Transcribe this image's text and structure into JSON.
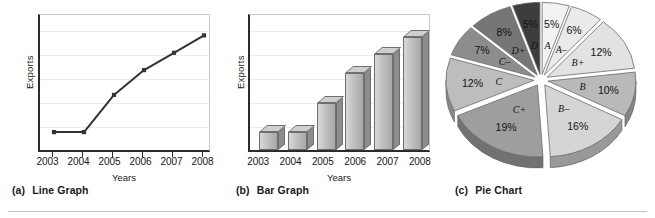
{
  "figure": {
    "panels": [
      {
        "caption_index": "(a)",
        "caption_label": "Line Graph"
      },
      {
        "caption_index": "(b)",
        "caption_label": "Bar Graph"
      },
      {
        "caption_index": "(c)",
        "caption_label": "Pie Chart"
      }
    ]
  },
  "chart_data": [
    {
      "type": "line",
      "title": "Line Graph",
      "xlabel": "Years",
      "ylabel": "Exports",
      "categories": [
        "2003",
        "2004",
        "2005",
        "2006",
        "2007",
        "2008"
      ],
      "x": [
        2003,
        2004,
        2005,
        2006,
        2007,
        2008
      ],
      "values": [
        12,
        12,
        42,
        62,
        76,
        90
      ],
      "ylim": [
        0,
        100
      ],
      "axis_values_shown": false,
      "grid": true,
      "legend": "none",
      "marker": "square"
    },
    {
      "type": "bar",
      "title": "Bar Graph",
      "xlabel": "Years",
      "ylabel": "Exports",
      "categories": [
        "2003",
        "2004",
        "2005",
        "2006",
        "2007",
        "2008"
      ],
      "values": [
        14,
        14,
        37,
        60,
        75,
        88
      ],
      "ylim": [
        0,
        100
      ],
      "axis_values_shown": false,
      "grid": true,
      "legend": "none",
      "style": "3d-column"
    },
    {
      "type": "pie",
      "title": "Pie Chart",
      "style": "exploded-3d",
      "legend": "none",
      "labels": [
        "A",
        "A–",
        "B+",
        "B",
        "B–",
        "C+",
        "C",
        "C–",
        "D+",
        "D"
      ],
      "values": [
        5,
        6,
        12,
        10,
        16,
        19,
        12,
        7,
        8,
        5
      ],
      "percent_labels": [
        "5%",
        "6%",
        "12%",
        "10%",
        "16%",
        "19%",
        "12%",
        "7%",
        "8%",
        "5%"
      ],
      "slices": [
        {
          "label": "A",
          "percent": 5,
          "percent_label": "5%",
          "color": "#f2f2f2"
        },
        {
          "label": "A–",
          "percent": 6,
          "percent_label": "6%",
          "color": "#eaeaea"
        },
        {
          "label": "B+",
          "percent": 12,
          "percent_label": "12%",
          "color": "#e2e2e2"
        },
        {
          "label": "B",
          "percent": 10,
          "percent_label": "10%",
          "color": "#b9b9b9"
        },
        {
          "label": "B–",
          "percent": 16,
          "percent_label": "16%",
          "color": "#d5d5d5"
        },
        {
          "label": "C+",
          "percent": 19,
          "percent_label": "19%",
          "color": "#9e9e9e"
        },
        {
          "label": "C",
          "percent": 12,
          "percent_label": "12%",
          "color": "#bdbdbd"
        },
        {
          "label": "C–",
          "percent": 7,
          "percent_label": "7%",
          "color": "#8d8d8d"
        },
        {
          "label": "D+",
          "percent": 8,
          "percent_label": "8%",
          "color": "#767676"
        },
        {
          "label": "D",
          "percent": 5,
          "percent_label": "5%",
          "color": "#3d3d3d"
        }
      ]
    }
  ]
}
